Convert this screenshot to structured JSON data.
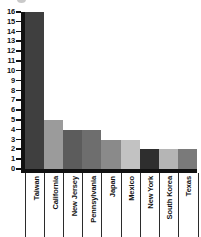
{
  "chart_data": {
    "type": "bar",
    "title": "",
    "subtitle": "",
    "xlabel": "",
    "ylabel": "",
    "categories": [
      "Taiwan",
      "California",
      "New Jersey",
      "Pennsylvania",
      "Japan",
      "Mexico",
      "New York",
      "South Korea",
      "Texas"
    ],
    "values": [
      16,
      5,
      4,
      4,
      3,
      3,
      2,
      2,
      2
    ],
    "bar_colors": [
      "#3f3f3f",
      "#9b9b9b",
      "#5c5c5c",
      "#6e6e6e",
      "#8a8a8a",
      "#c2c2c2",
      "#2e2e2e",
      "#b5b5b5",
      "#7a7a7a"
    ],
    "ylim": [
      0,
      16
    ],
    "yticks": [
      0,
      1,
      2,
      3,
      4,
      5,
      6,
      7,
      8,
      9,
      10,
      11,
      12,
      13,
      14,
      15,
      16
    ],
    "ytick_labels": [
      "0",
      "1",
      "2",
      "3",
      "4",
      "5",
      "6",
      "7",
      "8",
      "9",
      "10",
      "11",
      "12",
      "13",
      "14",
      "15",
      "16"
    ],
    "grid": false,
    "legend": null,
    "legend_position": "none",
    "axis_color": "#111111"
  }
}
